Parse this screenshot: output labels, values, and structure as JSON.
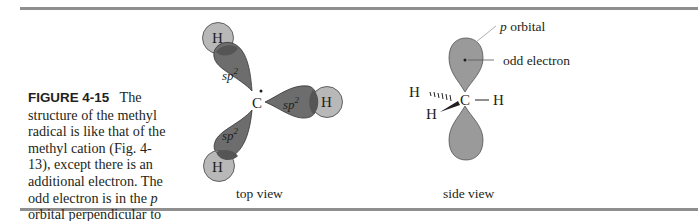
{
  "figure": {
    "number": "FIGURE 4-15",
    "caption_lines": [
      "The structure",
      "of the methyl radical is like",
      "that of the methyl cation (Fig.",
      "4-13), except there is an",
      "additional electron. The odd",
      "electron is in the ",
      "p",
      " orbital",
      "perpendicular to the plane of",
      "the three C—H bonds."
    ]
  },
  "top_view": {
    "label": "top view",
    "carbon": "C",
    "hydrogen": "H",
    "orbital": "sp",
    "orbital_sup": "2"
  },
  "side_view": {
    "label": "side view",
    "carbon": "C",
    "hydrogen": "H",
    "p_orbital_italic": "p",
    "p_orbital_label": " orbital",
    "odd_electron_label": "odd electron",
    "bond_dash": "—"
  },
  "colors": {
    "rule": "#8f8f8f",
    "sp2_lobe": "#6d6d6d",
    "h_sphere": "#b8b8b8",
    "p_lobe": "#9a9a9a",
    "text": "#231f20"
  }
}
